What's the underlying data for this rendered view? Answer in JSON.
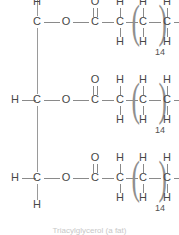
{
  "figure": {
    "title": "Triacylglycerol (a fat)",
    "molecule_name": "triacylglycerol",
    "line_color": "#8a8a8a",
    "text_color": "#474747",
    "background_color": "#ffffff"
  },
  "labels": {
    "C": "C",
    "H": "H",
    "O": "O",
    "repeat_count": "14",
    "paren_open": "(",
    "paren_close": ")"
  },
  "backbone": {
    "name": "glycerol-backbone",
    "carbons": [
      {
        "label": "C",
        "h_left": "",
        "h_top": "H",
        "h_bottom": ""
      },
      {
        "label": "C",
        "h_left": "H",
        "h_top": "",
        "h_bottom": ""
      },
      {
        "label": "C",
        "h_left": "H",
        "h_top": "",
        "h_bottom": "H"
      }
    ]
  },
  "chains": [
    {
      "name": "fatty-acid-chain-1",
      "ester_oxygen": "O",
      "carbonyl_carbon": "C",
      "carbonyl_oxygen": "O",
      "alpha_carbon": {
        "label": "C",
        "h_top": "H",
        "h_bottom": "H"
      },
      "repeat_unit": {
        "label": "C",
        "h_top": "H",
        "h_bottom": "H",
        "count": "14"
      },
      "terminal_carbon": {
        "label": "C",
        "h_top": "H",
        "h_bottom": "H",
        "h_right": "H"
      }
    },
    {
      "name": "fatty-acid-chain-2",
      "ester_oxygen": "O",
      "carbonyl_carbon": "C",
      "carbonyl_oxygen": "O",
      "alpha_carbon": {
        "label": "C",
        "h_top": "H",
        "h_bottom": "H"
      },
      "repeat_unit": {
        "label": "C",
        "h_top": "H",
        "h_bottom": "H",
        "count": "14"
      },
      "terminal_carbon": {
        "label": "C",
        "h_top": "H",
        "h_bottom": "H",
        "h_right": "H"
      }
    },
    {
      "name": "fatty-acid-chain-3",
      "ester_oxygen": "O",
      "carbonyl_carbon": "C",
      "carbonyl_oxygen": "O",
      "alpha_carbon": {
        "label": "C",
        "h_top": "H",
        "h_bottom": "H"
      },
      "repeat_unit": {
        "label": "C",
        "h_top": "H",
        "h_bottom": "H",
        "count": "14"
      },
      "terminal_carbon": {
        "label": "C",
        "h_top": "H",
        "h_bottom": "H",
        "h_right": "H"
      }
    }
  ]
}
